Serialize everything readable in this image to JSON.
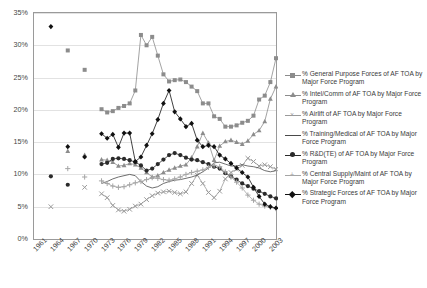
{
  "chart_data": {
    "type": "line",
    "title": "",
    "xlabel": "",
    "ylabel": "",
    "ylim": [
      0,
      35
    ],
    "yunit": "%",
    "ytick_labels": [
      "0%",
      "5%",
      "10%",
      "15%",
      "20%",
      "25%",
      "30%",
      "35%"
    ],
    "ytick_values": [
      0,
      5,
      10,
      15,
      20,
      25,
      30,
      35
    ],
    "grid": true,
    "legend_position": "right",
    "x_start": 1961,
    "x_end": 2004,
    "xtick_labels": [
      "1961",
      "1964",
      "1967",
      "1970",
      "1973",
      "1976",
      "1979",
      "1982",
      "1985",
      "1988",
      "1991",
      "1994",
      "1997",
      "2000",
      "2003"
    ],
    "xtick_values": [
      1961,
      1964,
      1967,
      1970,
      1973,
      1976,
      1979,
      1982,
      1985,
      1988,
      1991,
      1994,
      1997,
      2000,
      2003
    ],
    "colors": {
      "general_purpose": "#8c8c8c",
      "intel_comm": "#8c8c8c",
      "airlift": "#9a9a9a",
      "training_medical": "#4a4a4a",
      "rdte": "#2b2b2b",
      "central_supply": "#a5a5a5",
      "strategic": "#111111",
      "gridline": "#e2e2e2",
      "frame": "#9a9a9a",
      "background": "#ffffff"
    },
    "series": [
      {
        "name": "% General Purpose Forces of AF TOA by Major Force Program",
        "key": "general_purpose",
        "marker": "square",
        "color": "#8c8c8c",
        "points": [
          [
            1967,
            29.2
          ],
          [
            1970,
            26.2
          ],
          [
            1973,
            20.1
          ],
          [
            1974,
            19.6
          ],
          [
            1975,
            19.8
          ],
          [
            1976,
            20.3
          ],
          [
            1977,
            20.6
          ],
          [
            1978,
            21.0
          ],
          [
            1979,
            23.0
          ],
          [
            1980,
            31.6
          ],
          [
            1981,
            30.0
          ],
          [
            1982,
            31.3
          ],
          [
            1983,
            28.4
          ],
          [
            1984,
            25.5
          ],
          [
            1985,
            24.4
          ],
          [
            1986,
            24.6
          ],
          [
            1987,
            24.7
          ],
          [
            1988,
            24.3
          ],
          [
            1989,
            23.6
          ],
          [
            1990,
            22.9
          ],
          [
            1991,
            21.0
          ],
          [
            1992,
            21.0
          ],
          [
            1993,
            19.0
          ],
          [
            1994,
            18.6
          ],
          [
            1995,
            17.4
          ],
          [
            1996,
            17.4
          ],
          [
            1997,
            17.6
          ],
          [
            1998,
            18.0
          ],
          [
            1999,
            18.3
          ],
          [
            2000,
            19.1
          ],
          [
            2001,
            21.6
          ],
          [
            2002,
            22.2
          ],
          [
            2003,
            24.3
          ],
          [
            2004,
            28.0
          ]
        ]
      },
      {
        "name": "% Intel/Comm of AF TOA by Major Force Program",
        "key": "intel_comm",
        "marker": "triangle",
        "color": "#8c8c8c",
        "points": [
          [
            1967,
            13.6
          ],
          [
            1970,
            13.0
          ],
          [
            1973,
            12.3
          ],
          [
            1974,
            12.2
          ],
          [
            1975,
            11.9
          ],
          [
            1976,
            11.3
          ],
          [
            1977,
            11.4
          ],
          [
            1978,
            11.7
          ],
          [
            1979,
            11.5
          ],
          [
            1980,
            11.0
          ],
          [
            1981,
            10.3
          ],
          [
            1982,
            9.6
          ],
          [
            1983,
            9.8
          ],
          [
            1984,
            10.3
          ],
          [
            1985,
            10.7
          ],
          [
            1986,
            11.0
          ],
          [
            1987,
            11.3
          ],
          [
            1988,
            11.5
          ],
          [
            1989,
            12.6
          ],
          [
            1990,
            14.3
          ],
          [
            1991,
            16.4
          ],
          [
            1992,
            14.9
          ],
          [
            1993,
            12.2
          ],
          [
            1994,
            14.4
          ],
          [
            1995,
            15.1
          ],
          [
            1996,
            15.3
          ],
          [
            1997,
            15.0
          ],
          [
            1998,
            14.7
          ],
          [
            1999,
            15.2
          ],
          [
            2000,
            16.2
          ],
          [
            2001,
            16.8
          ],
          [
            2002,
            18.2
          ],
          [
            2003,
            21.7
          ],
          [
            2004,
            23.6
          ]
        ]
      },
      {
        "name": "% Airlift of AF TOA by Major Force Program",
        "key": "airlift",
        "marker": "x",
        "color": "#9a9a9a",
        "points": [
          [
            1964,
            5.0
          ],
          [
            1970,
            8.0
          ],
          [
            1973,
            7.0
          ],
          [
            1974,
            6.4
          ],
          [
            1975,
            5.2
          ],
          [
            1976,
            4.5
          ],
          [
            1977,
            4.3
          ],
          [
            1978,
            4.6
          ],
          [
            1979,
            5.1
          ],
          [
            1980,
            5.4
          ],
          [
            1981,
            6.1
          ],
          [
            1982,
            6.7
          ],
          [
            1983,
            7.1
          ],
          [
            1984,
            7.3
          ],
          [
            1985,
            7.4
          ],
          [
            1986,
            7.2
          ],
          [
            1987,
            7.0
          ],
          [
            1988,
            7.3
          ],
          [
            1989,
            8.6
          ],
          [
            1990,
            9.9
          ],
          [
            1991,
            8.6
          ],
          [
            1992,
            7.2
          ],
          [
            1993,
            6.4
          ],
          [
            1994,
            7.4
          ],
          [
            1995,
            9.3
          ],
          [
            1996,
            10.3
          ],
          [
            1997,
            10.8
          ],
          [
            1998,
            11.4
          ],
          [
            1999,
            12.5
          ],
          [
            2000,
            12.0
          ],
          [
            2001,
            11.3
          ],
          [
            2002,
            11.5
          ],
          [
            2003,
            11.2
          ],
          [
            2004,
            10.8
          ]
        ]
      },
      {
        "name": "% Training/Medical of AF TOA by Major Force Program",
        "key": "training_medical",
        "marker": "none",
        "color": "#4a4a4a",
        "points": [
          [
            1967,
            9.3
          ],
          [
            1970,
            9.0
          ],
          [
            1973,
            8.6
          ],
          [
            1974,
            8.9
          ],
          [
            1975,
            9.3
          ],
          [
            1976,
            9.6
          ],
          [
            1977,
            9.8
          ],
          [
            1978,
            10.0
          ],
          [
            1979,
            9.8
          ],
          [
            1980,
            8.9
          ],
          [
            1981,
            8.2
          ],
          [
            1982,
            7.9
          ],
          [
            1983,
            8.1
          ],
          [
            1984,
            8.6
          ],
          [
            1985,
            8.9
          ],
          [
            1986,
            9.1
          ],
          [
            1987,
            9.2
          ],
          [
            1988,
            9.4
          ],
          [
            1989,
            9.6
          ],
          [
            1990,
            9.9
          ],
          [
            1991,
            10.4
          ],
          [
            1992,
            11.0
          ],
          [
            1993,
            11.8
          ],
          [
            1994,
            11.9
          ],
          [
            1995,
            11.6
          ],
          [
            1996,
            11.3
          ],
          [
            1997,
            11.3
          ],
          [
            1998,
            11.5
          ],
          [
            1999,
            11.3
          ],
          [
            2000,
            11.2
          ],
          [
            2001,
            11.0
          ],
          [
            2002,
            10.6
          ],
          [
            2003,
            10.4
          ],
          [
            2004,
            10.6
          ]
        ]
      },
      {
        "name": "% R&D(TE) of AF TOA by Major Force Program",
        "key": "rdte",
        "marker": "filled-circle",
        "color": "#2b2b2b",
        "points": [
          [
            1964,
            9.7
          ],
          [
            1967,
            8.4
          ],
          [
            1973,
            11.6
          ],
          [
            1974,
            11.8
          ],
          [
            1975,
            12.4
          ],
          [
            1976,
            12.5
          ],
          [
            1977,
            12.4
          ],
          [
            1978,
            12.2
          ],
          [
            1979,
            11.9
          ],
          [
            1980,
            11.4
          ],
          [
            1981,
            10.6
          ],
          [
            1982,
            10.9
          ],
          [
            1983,
            11.6
          ],
          [
            1984,
            12.3
          ],
          [
            1985,
            13.0
          ],
          [
            1986,
            13.3
          ],
          [
            1987,
            13.0
          ],
          [
            1988,
            12.6
          ],
          [
            1989,
            12.3
          ],
          [
            1990,
            12.2
          ],
          [
            1991,
            11.9
          ],
          [
            1992,
            11.6
          ],
          [
            1993,
            11.2
          ],
          [
            1994,
            10.9
          ],
          [
            1995,
            10.2
          ],
          [
            1996,
            9.7
          ],
          [
            1997,
            9.2
          ],
          [
            1998,
            8.6
          ],
          [
            1999,
            8.2
          ],
          [
            2000,
            7.8
          ],
          [
            2001,
            7.4
          ],
          [
            2002,
            7.0
          ],
          [
            2003,
            6.6
          ],
          [
            2004,
            6.3
          ]
        ]
      },
      {
        "name": "% Central Supply/Maint of AF TOA by Major Force Program",
        "key": "central_supply",
        "marker": "plus",
        "color": "#a5a5a5",
        "points": [
          [
            1967,
            10.9
          ],
          [
            1970,
            9.6
          ],
          [
            1973,
            9.0
          ],
          [
            1974,
            8.6
          ],
          [
            1975,
            8.2
          ],
          [
            1976,
            8.0
          ],
          [
            1977,
            8.1
          ],
          [
            1978,
            8.4
          ],
          [
            1979,
            8.7
          ],
          [
            1980,
            8.9
          ],
          [
            1981,
            9.2
          ],
          [
            1982,
            9.5
          ],
          [
            1983,
            9.4
          ],
          [
            1984,
            9.2
          ],
          [
            1985,
            9.1
          ],
          [
            1986,
            9.3
          ],
          [
            1987,
            9.6
          ],
          [
            1988,
            10.0
          ],
          [
            1989,
            10.3
          ],
          [
            1990,
            10.5
          ],
          [
            1991,
            10.7
          ],
          [
            1992,
            11.1
          ],
          [
            1993,
            11.4
          ],
          [
            1994,
            11.2
          ],
          [
            1995,
            10.4
          ],
          [
            1996,
            9.6
          ],
          [
            1997,
            8.8
          ],
          [
            1998,
            7.9
          ],
          [
            1999,
            6.8
          ],
          [
            2000,
            6.0
          ],
          [
            2001,
            5.4
          ],
          [
            2002,
            5.1
          ],
          [
            2003,
            4.9
          ],
          [
            2004,
            4.7
          ]
        ]
      },
      {
        "name": "% Strategic Forces of AF TOA by Major Force Program",
        "key": "strategic",
        "marker": "diamond",
        "color": "#111111",
        "points": [
          [
            1964,
            32.9
          ],
          [
            1967,
            14.3
          ],
          [
            1970,
            12.7
          ],
          [
            1973,
            16.3
          ],
          [
            1974,
            15.6
          ],
          [
            1975,
            16.2
          ],
          [
            1976,
            14.2
          ],
          [
            1977,
            16.4
          ],
          [
            1978,
            16.4
          ],
          [
            1979,
            12.0
          ],
          [
            1980,
            12.7
          ],
          [
            1981,
            14.5
          ],
          [
            1982,
            16.3
          ],
          [
            1983,
            18.5
          ],
          [
            1984,
            21.0
          ],
          [
            1985,
            23.0
          ],
          [
            1986,
            19.7
          ],
          [
            1987,
            18.6
          ],
          [
            1988,
            17.4
          ],
          [
            1989,
            17.9
          ],
          [
            1990,
            15.3
          ],
          [
            1991,
            14.3
          ],
          [
            1992,
            14.5
          ],
          [
            1993,
            14.3
          ],
          [
            1994,
            13.0
          ],
          [
            1995,
            12.4
          ],
          [
            1996,
            11.7
          ],
          [
            1997,
            11.0
          ],
          [
            1998,
            10.3
          ],
          [
            1999,
            9.6
          ],
          [
            2000,
            8.0
          ],
          [
            2001,
            6.6
          ],
          [
            2002,
            5.4
          ],
          [
            2003,
            5.0
          ],
          [
            2004,
            4.8
          ]
        ]
      }
    ]
  },
  "legend": {
    "items": [
      {
        "label": "% General Purpose Forces of AF TOA by Major Force Program",
        "marker": "square",
        "color": "#8c8c8c"
      },
      {
        "label": "% Intel/Comm of AF TOA by Major Force Program",
        "marker": "triangle",
        "color": "#8c8c8c"
      },
      {
        "label": "% Airlift of AF TOA by Major Force Program",
        "marker": "x",
        "color": "#9a9a9a"
      },
      {
        "label": "% Training/Medical of AF TOA by Major Force Program",
        "marker": "none",
        "color": "#4a4a4a"
      },
      {
        "label": "% R&D(TE) of AF TOA by Major Force Program",
        "marker": "filled-circle",
        "color": "#2b2b2b"
      },
      {
        "label": "% Central Supply/Maint of AF TOA by Major Force Program",
        "marker": "plus",
        "color": "#a5a5a5"
      },
      {
        "label": "% Strategic Forces of AF TOA by Major Force Program",
        "marker": "diamond",
        "color": "#111111"
      }
    ]
  }
}
